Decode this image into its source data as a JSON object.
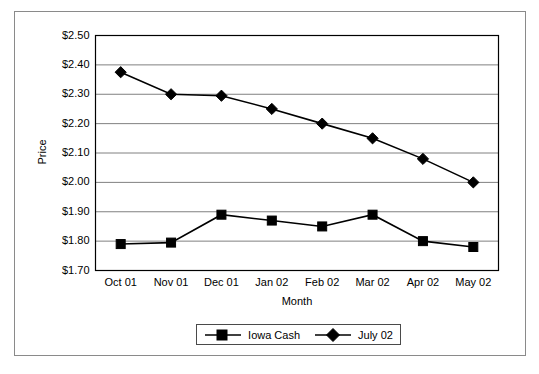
{
  "chart_data": {
    "type": "line",
    "title": "",
    "xlabel": "Month",
    "ylabel": "Price",
    "categories": [
      "Oct 01",
      "Nov 01",
      "Dec 01",
      "Jan 02",
      "Feb 02",
      "Mar 02",
      "Apr 02",
      "May 02"
    ],
    "ylim": [
      1.7,
      2.5
    ],
    "ytick_step": 0.1,
    "ytick_labels": [
      "$2.50",
      "$2.40",
      "$2.30",
      "$2.20",
      "$2.10",
      "$2.00",
      "$1.90",
      "$1.80",
      "$1.70"
    ],
    "ytick_values": [
      2.5,
      2.4,
      2.3,
      2.2,
      2.1,
      2.0,
      1.9,
      1.8,
      1.7
    ],
    "grid": true,
    "grid_axis": "y",
    "legend_position": "bottom",
    "series": [
      {
        "name": "Iowa Cash",
        "marker": "square",
        "color": "#000000",
        "values": [
          1.79,
          1.795,
          1.89,
          1.87,
          1.85,
          1.89,
          1.8,
          1.78
        ]
      },
      {
        "name": "July 02",
        "marker": "diamond",
        "color": "#000000",
        "values": [
          2.375,
          2.3,
          2.295,
          2.25,
          2.2,
          2.15,
          2.08,
          2.0
        ]
      }
    ]
  },
  "colors": {
    "plot_border": "#000000",
    "grid": "#808080",
    "outer_frame": "#8a8a8a",
    "line": "#000000",
    "background": "#ffffff"
  }
}
